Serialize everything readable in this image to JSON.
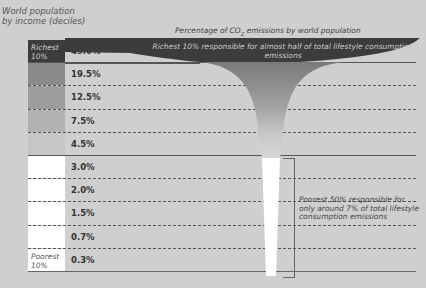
{
  "chart_data": {
    "type": "bar",
    "title": "Percentage of CO2 emissions by world population",
    "xlabel": "",
    "ylabel": "World population by income (deciles)",
    "categories": [
      "Richest 10%",
      "Decile 9",
      "Decile 8",
      "Decile 7",
      "Decile 6",
      "Decile 5",
      "Decile 4",
      "Decile 3",
      "Decile 2",
      "Poorest 10%"
    ],
    "values": [
      49.0,
      19.5,
      12.5,
      7.5,
      4.5,
      3.0,
      2.0,
      1.5,
      0.7,
      0.3
    ],
    "value_labels": [
      "49.0%",
      "19.5%",
      "12.5%",
      "7.5%",
      "4.5%",
      "3.0%",
      "2.0%",
      "1.5%",
      "0.7%",
      "0.3%"
    ],
    "unit": "%",
    "annotations": [
      "Richest 10% responsible for almost half of total lifestyle consumption emissions",
      "Poorest 50% responsible for only around 7% of total lifestyle consumption emissions"
    ],
    "grid": false,
    "legend": "none"
  },
  "axis": {
    "ylabel_line1": "World population",
    "ylabel_line2": "by income (deciles)"
  },
  "title": {
    "prefix": "Percentage of  CO",
    "sub": "2",
    "suffix": " emissions by world population"
  },
  "rows": [
    {
      "swatch_label": "Richest 10%",
      "pct": "49.0%",
      "color": "#3c3c3c",
      "text_color": "#cfcfcf"
    },
    {
      "swatch_label": "",
      "pct": "19.5%",
      "color": "#8a8a8a"
    },
    {
      "swatch_label": "",
      "pct": "12.5%",
      "color": "#9c9c9c"
    },
    {
      "swatch_label": "",
      "pct": "7.5%",
      "color": "#b2b2b2"
    },
    {
      "swatch_label": "",
      "pct": "4.5%",
      "color": "#c6c6c6"
    },
    {
      "swatch_label": "",
      "pct": "3.0%",
      "color": "#ffffff"
    },
    {
      "swatch_label": "",
      "pct": "2.0%",
      "color": "#ffffff"
    },
    {
      "swatch_label": "",
      "pct": "1.5%",
      "color": "#ffffff"
    },
    {
      "swatch_label": "",
      "pct": "0.7%",
      "color": "#ffffff"
    },
    {
      "swatch_label": "Poorest 10%",
      "pct": "0.3%",
      "color": "#ffffff",
      "text_color": "#555555"
    }
  ],
  "annotations": {
    "richest": "Richest 10% responsible for almost half of total lifestyle consumption emissions",
    "poorest": "Poorest 50% responsible for only around 7% of total lifestyle consumption emissions"
  },
  "colors": {
    "background": "#cfcfcf",
    "dark": "#3c3c3c",
    "funnel_mid": "#8f8f8f"
  }
}
